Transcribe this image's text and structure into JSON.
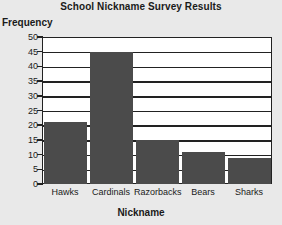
{
  "chart_data": {
    "type": "bar",
    "title": "School Nickname Survey Results",
    "xlabel": "Nickname",
    "ylabel": "Frequency",
    "categories": [
      "Hawks",
      "Cardinals",
      "Razorbacks",
      "Bears",
      "Sharks"
    ],
    "values": [
      21,
      45,
      15,
      11,
      9
    ],
    "ylim": [
      0,
      50
    ],
    "ytick_labels": [
      "0",
      "5",
      "10",
      "15",
      "20",
      "25",
      "30",
      "35",
      "40",
      "45",
      "50"
    ],
    "ytick_values": [
      0,
      5,
      10,
      15,
      20,
      25,
      30,
      35,
      40,
      45,
      50
    ],
    "grid": "horizontal",
    "legend": "none",
    "bar_color": "#4b4b4b",
    "axis_color": "#222222",
    "plot_background": "#ffffff",
    "figure_background": "#e9e9e9"
  }
}
